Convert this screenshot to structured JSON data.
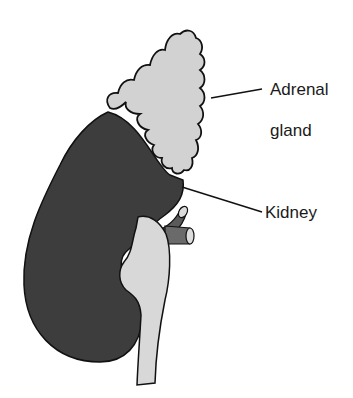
{
  "diagram": {
    "labels": {
      "adrenal_line1": "Adrenal",
      "adrenal_line2": "gland",
      "kidney": "Kidney"
    },
    "colors": {
      "kidney_fill": "#3d3d3d",
      "adrenal_fill": "#d2d2d2",
      "pelvis_fill": "#d8d8d8",
      "vessel_fill": "#6a6a6a",
      "outline": "#111111"
    }
  }
}
